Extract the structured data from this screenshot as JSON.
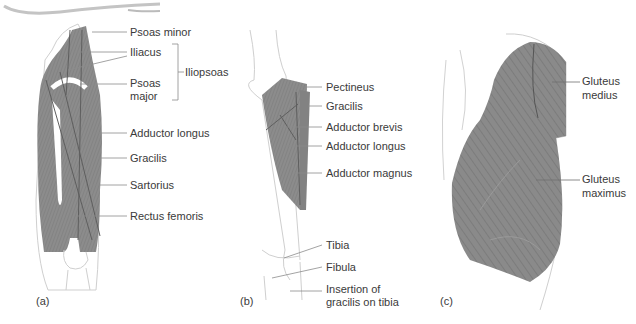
{
  "figure": {
    "colors": {
      "muscle": "#8a8a8a",
      "muscle_dark": "#6e6e6e",
      "outline": "#c8c8c8",
      "leader": "#8c8c8c",
      "text": "#3a3a3a"
    },
    "panels": [
      {
        "id": "a",
        "caption": "(a)",
        "labels": [
          {
            "text": "Psoas minor"
          },
          {
            "text": "Iliacus"
          },
          {
            "text": "Psoas"
          },
          {
            "text": "major"
          },
          {
            "text": "Adductor longus"
          },
          {
            "text": "Gracilis"
          },
          {
            "text": "Sartorius"
          },
          {
            "text": "Rectus femoris"
          }
        ],
        "group_label": "Iliopsoas"
      },
      {
        "id": "b",
        "caption": "(b)",
        "labels": [
          {
            "text": "Pectineus"
          },
          {
            "text": "Gracilis"
          },
          {
            "text": "Adductor brevis"
          },
          {
            "text": "Adductor longus"
          },
          {
            "text": "Adductor magnus"
          },
          {
            "text": "Tibia"
          },
          {
            "text": "Fibula"
          },
          {
            "text": "Insertion of"
          },
          {
            "text": "gracilis on tibia"
          }
        ]
      },
      {
        "id": "c",
        "caption": "(c)",
        "labels": [
          {
            "text": "Gluteus"
          },
          {
            "text": "medius"
          },
          {
            "text": "Gluteus"
          },
          {
            "text": "maximus"
          }
        ]
      }
    ]
  }
}
